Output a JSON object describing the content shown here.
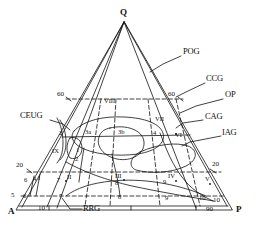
{
  "diagram": {
    "type": "ternary-qap-classification",
    "title": "",
    "vertices": [
      {
        "id": "Q",
        "label": "Q",
        "x": 124,
        "y": 14
      },
      {
        "id": "A",
        "label": "A",
        "x": 12,
        "y": 213
      },
      {
        "id": "P",
        "label": "P",
        "x": 238,
        "y": 211
      }
    ],
    "axis_ticks": [
      {
        "label": "60",
        "x": 62,
        "y": 95,
        "side": "left-upper"
      },
      {
        "label": "60",
        "x": 172,
        "y": 95,
        "side": "right-upper"
      },
      {
        "label": "20",
        "x": 21,
        "y": 166,
        "side": "left-lower"
      },
      {
        "label": "20",
        "x": 215,
        "y": 165,
        "side": "right-lower"
      },
      {
        "label": "5",
        "x": 14,
        "y": 196,
        "side": "left-edge"
      },
      {
        "label": "6",
        "x": 26,
        "y": 197,
        "side": "left-edge"
      },
      {
        "label": "10",
        "x": 42,
        "y": 208,
        "side": "base"
      },
      {
        "label": "90",
        "x": 211,
        "y": 209,
        "side": "base"
      },
      {
        "label": "10",
        "x": 217,
        "y": 201,
        "side": "right-edge"
      }
    ],
    "internal_numbers": [
      {
        "label": "2",
        "x": 68,
        "y": 133
      },
      {
        "label": "3a",
        "x": 90,
        "y": 132
      },
      {
        "label": "3b",
        "x": 123,
        "y": 132
      },
      {
        "label": "4",
        "x": 156,
        "y": 133
      },
      {
        "label": "1",
        "x": 78,
        "y": 150
      },
      {
        "label": "2",
        "x": 77,
        "y": 159
      },
      {
        "label": "6",
        "x": 26,
        "y": 181
      },
      {
        "label": "4",
        "x": 35,
        "y": 180
      },
      {
        "label": "7",
        "x": 60,
        "y": 181
      },
      {
        "label": "7",
        "x": 62,
        "y": 197
      },
      {
        "label": "8",
        "x": 118,
        "y": 184
      },
      {
        "label": "8",
        "x": 121,
        "y": 198
      },
      {
        "label": "9",
        "x": 166,
        "y": 183
      },
      {
        "label": "9",
        "x": 168,
        "y": 199
      },
      {
        "label": "10",
        "x": 203,
        "y": 184
      }
    ],
    "field_labels": [
      {
        "label": "I",
        "x": 40,
        "y": 179
      },
      {
        "label": "II",
        "x": 70,
        "y": 178
      },
      {
        "label": "III",
        "x": 118,
        "y": 177
      },
      {
        "label": "IV",
        "x": 171,
        "y": 177
      },
      {
        "label": "VI",
        "x": 178,
        "y": 136
      },
      {
        "label": "VII",
        "x": 158,
        "y": 120
      },
      {
        "label": "VIII",
        "x": 108,
        "y": 102
      },
      {
        "label": "IX",
        "x": 55,
        "y": 152
      },
      {
        "label": "V",
        "x": 207,
        "y": 180
      },
      {
        "label": "2",
        "x": 60,
        "y": 134
      }
    ],
    "callouts": [
      {
        "id": "POG",
        "label": "POG",
        "x": 183,
        "y": 52,
        "leader": [
          [
            180,
            56
          ],
          [
            163,
            64
          ]
        ]
      },
      {
        "id": "CCG",
        "label": "CCG",
        "x": 207,
        "y": 79,
        "leader": [
          [
            205,
            83
          ],
          [
            188,
            91
          ]
        ]
      },
      {
        "id": "OP",
        "label": "OP",
        "x": 225,
        "y": 95,
        "leader": [
          [
            223,
            99
          ],
          [
            193,
            107
          ]
        ]
      },
      {
        "id": "CAG",
        "label": "CAG",
        "x": 205,
        "y": 117,
        "leader": [
          [
            203,
            120
          ],
          [
            180,
            124
          ]
        ]
      },
      {
        "id": "IAG",
        "label": "IAG",
        "x": 223,
        "y": 133,
        "leader": [
          [
            221,
            136
          ],
          [
            186,
            143
          ]
        ]
      },
      {
        "id": "CEUG",
        "label": "CEUG",
        "x": 24,
        "y": 116,
        "leader": [
          [
            52,
            120
          ],
          [
            66,
            128
          ]
        ]
      },
      {
        "id": "RRG",
        "label": "RRG",
        "x": 84,
        "y": 209,
        "leader": [
          [
            82,
            209
          ],
          [
            70,
            209
          ]
        ]
      }
    ],
    "legend_note": ""
  },
  "colors": {
    "ink": "#111111",
    "background": "#ffffff"
  }
}
